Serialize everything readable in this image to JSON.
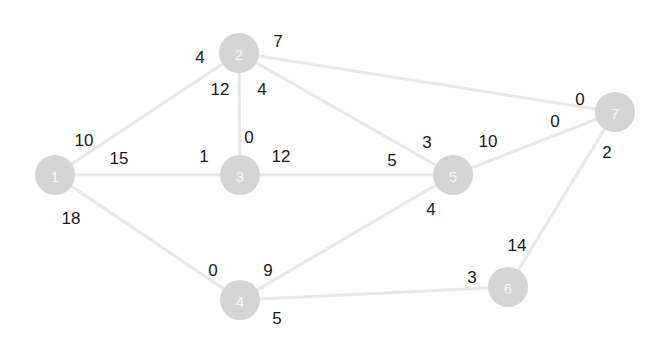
{
  "graph": {
    "title": "",
    "node_radius": 20,
    "node_fill": "#d4d4d4",
    "node_text_color": "#f7f7f7",
    "edge_color": "#e8e8e8",
    "weight_text_color": "#1a1a1a",
    "nodes": [
      {
        "id": "n1",
        "label": "1",
        "x": 55,
        "y": 175
      },
      {
        "id": "n2",
        "label": "2",
        "x": 239,
        "y": 53
      },
      {
        "id": "n3",
        "label": "3",
        "x": 240,
        "y": 175
      },
      {
        "id": "n4",
        "label": "4",
        "x": 240,
        "y": 300
      },
      {
        "id": "n5",
        "label": "5",
        "x": 453,
        "y": 175
      },
      {
        "id": "n6",
        "label": "6",
        "x": 508,
        "y": 287
      },
      {
        "id": "n7",
        "label": "7",
        "x": 615,
        "y": 112
      }
    ],
    "edges": [
      {
        "id": "e1-2",
        "from": "n1",
        "to": "n2",
        "x1": 55,
        "y1": 175,
        "x2": 239,
        "y2": 53
      },
      {
        "id": "e1-3",
        "from": "n1",
        "to": "n3",
        "x1": 55,
        "y1": 175,
        "x2": 240,
        "y2": 175
      },
      {
        "id": "e1-4",
        "from": "n1",
        "to": "n4",
        "x1": 55,
        "y1": 175,
        "x2": 240,
        "y2": 300
      },
      {
        "id": "e2-3",
        "from": "n2",
        "to": "n3",
        "x1": 239,
        "y1": 53,
        "x2": 240,
        "y2": 175
      },
      {
        "id": "e2-5",
        "from": "n2",
        "to": "n5",
        "x1": 239,
        "y1": 53,
        "x2": 453,
        "y2": 175
      },
      {
        "id": "e2-7",
        "from": "n2",
        "to": "n7",
        "x1": 239,
        "y1": 53,
        "x2": 615,
        "y2": 112
      },
      {
        "id": "e3-5",
        "from": "n3",
        "to": "n5",
        "x1": 240,
        "y1": 175,
        "x2": 453,
        "y2": 175
      },
      {
        "id": "e4-5",
        "from": "n4",
        "to": "n5",
        "x1": 240,
        "y1": 300,
        "x2": 453,
        "y2": 175
      },
      {
        "id": "e4-6",
        "from": "n4",
        "to": "n6",
        "x1": 240,
        "y1": 300,
        "x2": 508,
        "y2": 287
      },
      {
        "id": "e5-7",
        "from": "n5",
        "to": "n7",
        "x1": 453,
        "y1": 175,
        "x2": 615,
        "y2": 112
      },
      {
        "id": "e6-7",
        "from": "n6",
        "to": "n7",
        "x1": 508,
        "y1": 287,
        "x2": 615,
        "y2": 112
      }
    ],
    "weights": [
      {
        "id": "w1-2-a",
        "edge": "e1-2",
        "near": "n1",
        "value": "10",
        "x": 84,
        "y": 140
      },
      {
        "id": "w1-2-b",
        "edge": "e1-2",
        "near": "n2",
        "value": "4",
        "x": 200,
        "y": 57
      },
      {
        "id": "w1-3-a",
        "edge": "e1-3",
        "near": "n1",
        "value": "15",
        "x": 119,
        "y": 158
      },
      {
        "id": "w1-3-b",
        "edge": "e1-3",
        "near": "n3",
        "value": "1",
        "x": 204,
        "y": 156
      },
      {
        "id": "w1-4-a",
        "edge": "e1-4",
        "near": "n1",
        "value": "18",
        "x": 71,
        "y": 218
      },
      {
        "id": "w1-4-b",
        "edge": "e1-4",
        "near": "n4",
        "value": "0",
        "x": 213,
        "y": 270
      },
      {
        "id": "w2-3-a",
        "edge": "e2-3",
        "near": "n2",
        "value": "12",
        "x": 220,
        "y": 89
      },
      {
        "id": "w2-3-b",
        "edge": "e2-3",
        "near": "n3",
        "value": "0",
        "x": 249,
        "y": 137
      },
      {
        "id": "w2-5-a",
        "edge": "e2-5",
        "near": "n2",
        "value": "4",
        "x": 262,
        "y": 89
      },
      {
        "id": "w2-5-b",
        "edge": "e2-5",
        "near": "n5",
        "value": "3",
        "x": 427,
        "y": 142
      },
      {
        "id": "w2-7-a",
        "edge": "e2-7",
        "near": "n2",
        "value": "7",
        "x": 278,
        "y": 41
      },
      {
        "id": "w2-7-b",
        "edge": "e2-7",
        "near": "n7",
        "value": "0",
        "x": 580,
        "y": 99
      },
      {
        "id": "w3-5-a",
        "edge": "e3-5",
        "near": "n3",
        "value": "12",
        "x": 281,
        "y": 156
      },
      {
        "id": "w3-5-b",
        "edge": "e3-5",
        "near": "n5",
        "value": "5",
        "x": 392,
        "y": 160
      },
      {
        "id": "w4-5-a",
        "edge": "e4-5",
        "near": "n4",
        "value": "9",
        "x": 268,
        "y": 270
      },
      {
        "id": "w4-5-b",
        "edge": "e4-5",
        "near": "n5",
        "value": "4",
        "x": 431,
        "y": 209
      },
      {
        "id": "w4-6-a",
        "edge": "e4-6",
        "near": "n4",
        "value": "5",
        "x": 277,
        "y": 318
      },
      {
        "id": "w4-6-b",
        "edge": "e4-6",
        "near": "n6",
        "value": "3",
        "x": 472,
        "y": 277
      },
      {
        "id": "w5-7-a",
        "edge": "e5-7",
        "near": "n5",
        "value": "10",
        "x": 488,
        "y": 141
      },
      {
        "id": "w5-7-b",
        "edge": "e5-7",
        "near": "n7",
        "value": "0",
        "x": 555,
        "y": 121
      },
      {
        "id": "w6-7-a",
        "edge": "e6-7",
        "near": "n6",
        "value": "14",
        "x": 517,
        "y": 245
      },
      {
        "id": "w6-7-b",
        "edge": "e6-7",
        "near": "n7",
        "value": "2",
        "x": 607,
        "y": 152
      }
    ]
  }
}
